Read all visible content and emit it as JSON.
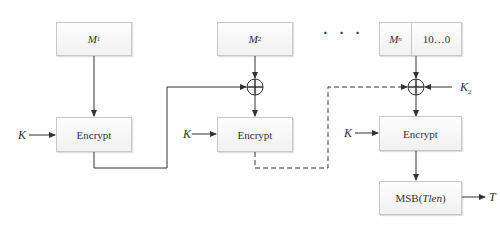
{
  "diagram": {
    "blocks": {
      "m1": {
        "name": "M",
        "sub": "1"
      },
      "m2": {
        "name": "M",
        "sub": "2"
      },
      "mn": {
        "name": "M",
        "sub": "n"
      },
      "padding": "10…0",
      "encrypt_1": "Encrypt",
      "encrypt_2": "Encrypt",
      "encrypt_3": "Encrypt",
      "msb_prefix": "MSB(",
      "msb_arg": "Tlen",
      "msb_suffix": ")"
    },
    "labels": {
      "key_1": "K",
      "key_2": "K",
      "key_3": "K",
      "subkey": "K",
      "subkey_sub": "2",
      "output": "T",
      "ellipsis": "· · ·"
    },
    "colors": {
      "line": "#333333",
      "box_border": "#c8c8c8",
      "box_fill": "#f5f5f5"
    }
  }
}
